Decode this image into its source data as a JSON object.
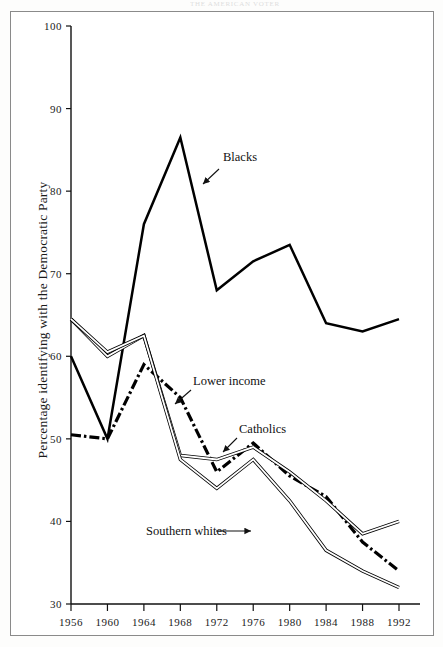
{
  "page": {
    "header_text": "THE AMERICAN VOTER"
  },
  "chart_data": {
    "type": "line",
    "title": "",
    "subtitle": "",
    "xlabel": "",
    "ylabel": "Percentage identifying with the Democratic Party",
    "categories": [
      1956,
      1960,
      1964,
      1968,
      1972,
      1976,
      1980,
      1984,
      1988,
      1992
    ],
    "xtick_labels": [
      "1956",
      "1960",
      "1964",
      "1968",
      "1972",
      "1976",
      "1980",
      "1984",
      "1988",
      "1992"
    ],
    "ytick_labels": [
      "30",
      "40",
      "50",
      "60",
      "70",
      "80",
      "90",
      "100"
    ],
    "yticks": [
      30,
      40,
      50,
      60,
      70,
      80,
      90,
      100
    ],
    "ylim": [
      30,
      100
    ],
    "xlim": [
      1954,
      1994
    ],
    "grid": false,
    "legend_position": "inline-annotations",
    "series": [
      {
        "name": "Blacks",
        "style": "thick-solid",
        "color": "#000000",
        "label_x": 1970,
        "label_y": 83,
        "values": [
          60.0,
          50.0,
          76.0,
          86.5,
          68.0,
          71.5,
          73.5,
          64.0,
          63.0,
          64.5
        ]
      },
      {
        "name": "Lower income",
        "style": "dash-dot-thick",
        "color": "#000000",
        "label_x": 1969,
        "label_y": 57.5,
        "values": [
          50.5,
          50.0,
          59.0,
          55.0,
          46.0,
          49.5,
          45.5,
          43.0,
          37.5,
          34.0
        ]
      },
      {
        "name": "Catholics",
        "style": "thin-double",
        "color": "#000000",
        "label_x": 1977,
        "label_y": 52,
        "values": [
          64.5,
          60.0,
          62.5,
          48.0,
          47.5,
          49.0,
          46.0,
          42.5,
          38.5,
          40.0
        ]
      },
      {
        "name": "Southern whites",
        "style": "thin-double",
        "color": "#000000",
        "label_x": 1970,
        "label_y": 39,
        "values": [
          64.5,
          60.5,
          62.5,
          47.5,
          44.0,
          47.5,
          42.5,
          36.5,
          34.0,
          32.0
        ]
      }
    ],
    "annotations": [
      {
        "text": "Blacks",
        "target_year": 1968,
        "target_value": 84.0
      },
      {
        "text": "Lower income",
        "target_year": 1968,
        "target_value": 55.0
      },
      {
        "text": "Catholics",
        "target_year": 1976,
        "target_value": 49.0
      },
      {
        "text": "Southern whites",
        "target_year": 1983,
        "target_value": 38.0
      }
    ]
  }
}
